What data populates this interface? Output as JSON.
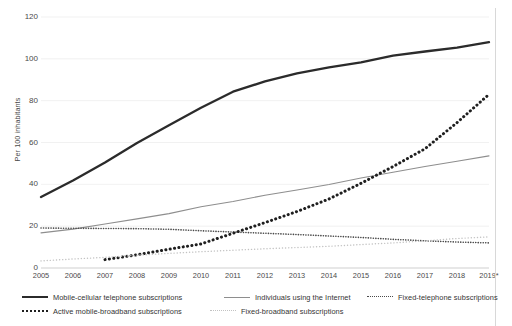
{
  "chart_data": {
    "type": "line",
    "title": "",
    "xlabel": "",
    "ylabel": "Per 100 inhabitants",
    "ylim": [
      0,
      120
    ],
    "yticks": [
      0,
      20,
      40,
      60,
      80,
      100,
      120
    ],
    "grid": true,
    "legend_position": "bottom",
    "categories": [
      "2005",
      "2006",
      "2007",
      "2008",
      "2009",
      "2010",
      "2011",
      "2012",
      "2013",
      "2014",
      "2015",
      "2016",
      "2017",
      "2018",
      "2019*"
    ],
    "series": [
      {
        "name": "Mobile-cellular telephone subscriptions",
        "style": "solid-bold",
        "color": "#2b2b2b",
        "values": [
          33.9,
          41.8,
          50.4,
          59.8,
          68.2,
          76.6,
          84.3,
          89.2,
          93.1,
          95.9,
          98.3,
          101.5,
          103.5,
          105.4,
          108.0
        ]
      },
      {
        "name": "Individuals using the Internet",
        "style": "solid-thin",
        "color": "#8e8e8e",
        "values": [
          16.8,
          18.6,
          21.0,
          23.5,
          26.0,
          29.3,
          31.8,
          34.8,
          37.3,
          39.9,
          43.0,
          45.8,
          48.5,
          51.0,
          53.6
        ]
      },
      {
        "name": "Fixed-telephone subscriptions",
        "style": "dotted-fine",
        "color": "#4a4a4a",
        "values": [
          19.1,
          19.0,
          18.9,
          18.8,
          18.5,
          17.8,
          17.2,
          16.6,
          16.0,
          15.3,
          14.6,
          13.7,
          13.0,
          12.4,
          12.0
        ]
      },
      {
        "name": "Active mobile-broadband subscriptions",
        "style": "dotted-bold",
        "color": "#1f1f1f",
        "values": [
          null,
          null,
          4.0,
          6.3,
          9.0,
          11.5,
          16.6,
          21.7,
          27.0,
          33.0,
          40.5,
          48.5,
          57.0,
          69.5,
          83.0
        ]
      },
      {
        "name": "Fixed-broadband subscriptions",
        "style": "dotted-light",
        "color": "#c2c2c2",
        "values": [
          3.4,
          4.3,
          5.1,
          6.1,
          7.0,
          7.8,
          8.5,
          9.2,
          9.8,
          10.4,
          11.2,
          12.0,
          13.0,
          14.1,
          14.9
        ]
      }
    ]
  },
  "axis": {
    "y_title": "Per 100 inhabitants",
    "y_ticks": [
      "0",
      "20",
      "40",
      "60",
      "80",
      "100",
      "120"
    ],
    "x_ticks": [
      "2005",
      "2006",
      "2007",
      "2008",
      "2009",
      "2010",
      "2011",
      "2012",
      "2013",
      "2014",
      "2015",
      "2016",
      "2017",
      "2018",
      "2019*"
    ]
  },
  "legend": {
    "items": [
      {
        "label": "Mobile-cellular telephone subscriptions",
        "style": "solid-bold"
      },
      {
        "label": "Individuals using the Internet",
        "style": "solid-thin"
      },
      {
        "label": "Fixed-telephone subscriptions",
        "style": "dotted-fine"
      },
      {
        "label": "Active mobile-broadband subscriptions",
        "style": "dotted-bold"
      },
      {
        "label": "Fixed-broadband subscriptions",
        "style": "dotted-light"
      }
    ]
  }
}
